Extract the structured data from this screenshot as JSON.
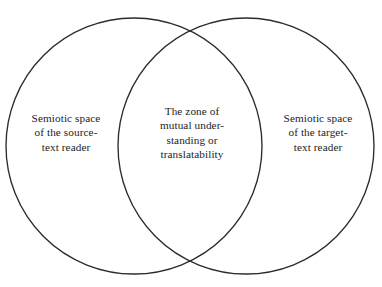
{
  "figure": {
    "type": "venn-diagram",
    "background_color": "#ffffff",
    "stroke_color": "#2b2b2b",
    "text_color": "#232323",
    "width": 382,
    "height": 287
  },
  "regions": {
    "left": {
      "name": "source-text-reader-space",
      "text": "Semiotic space\nof the source-\ntext reader",
      "lines": [
        "Semiotic space",
        "of the source-",
        "text reader"
      ]
    },
    "center": {
      "name": "overlap-zone",
      "text": "The zone of\nmutual under-\nstanding or\ntranslatability",
      "lines": [
        "The zone of",
        "mutual under-",
        "standing or",
        "translatability"
      ]
    },
    "right": {
      "name": "target-text-reader-space",
      "text": "Semiotic space\nof the target-\ntext reader",
      "lines": [
        "Semiotic space",
        "of the target-",
        "text reader"
      ]
    }
  },
  "geometry": {
    "left_circle": {
      "cx": 134,
      "cy": 146,
      "r": 128
    },
    "right_circle": {
      "cx": 246,
      "cy": 146,
      "r": 128
    }
  }
}
